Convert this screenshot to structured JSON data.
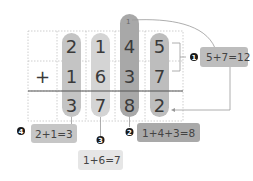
{
  "problem": {
    "operator": "+",
    "top": [
      "2",
      "1",
      "4",
      "5"
    ],
    "bottom": [
      "1",
      "6",
      "3",
      "7"
    ],
    "result": [
      "3",
      "7",
      "8",
      "2"
    ]
  },
  "steps": [
    {
      "number": "1",
      "label": "5+7=12"
    },
    {
      "number": "2",
      "label": "1+4+3=8",
      "carry": "1"
    },
    {
      "number": "3",
      "label": "1+6=7"
    },
    {
      "number": "4",
      "label": "2+1=3"
    }
  ],
  "carry_marks": [
    "1"
  ],
  "colors": {
    "col1": "#c4c4c4",
    "col2": "#d4d4d4",
    "col3": "#a8a8a8",
    "col4": "#bdbdbd",
    "step1_box": "#bdbdbd",
    "step2_box": "#a9a9a9",
    "step3_box": "#e6e6e6",
    "step4_box": "#c6c6c6",
    "badge": "#1a1a1a",
    "grid": "#bbbbbb",
    "line": "#555555"
  }
}
